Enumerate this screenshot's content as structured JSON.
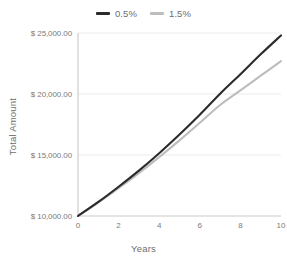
{
  "chart_data": {
    "type": "line",
    "title": "",
    "xlabel": "Years",
    "ylabel": "Total Amount",
    "xlim": [
      0,
      10
    ],
    "ylim": [
      10000,
      25000
    ],
    "grid": true,
    "legend_position": "top-center",
    "x": [
      0,
      1,
      2,
      3,
      4,
      5,
      6,
      7,
      8,
      9,
      10
    ],
    "xticks": [
      "0",
      "2",
      "4",
      "6",
      "8",
      "10"
    ],
    "xtick_values": [
      0,
      2,
      4,
      6,
      8,
      10
    ],
    "yticks": [
      "$ 10,000.00",
      "$ 15,000.00",
      "$ 20,000.00",
      "$ 25,000.00"
    ],
    "ytick_values": [
      10000,
      15000,
      20000,
      25000
    ],
    "series": [
      {
        "name": "0.5%",
        "color": "#2b2b2b",
        "values": [
          10000,
          11150,
          12400,
          13720,
          15150,
          16680,
          18300,
          20020,
          21620,
          23250,
          24800
        ]
      },
      {
        "name": "1.5%",
        "color": "#bdbdbd",
        "values": [
          10000,
          11100,
          12280,
          13520,
          14830,
          16200,
          17640,
          19100,
          20300,
          21500,
          22700
        ]
      }
    ]
  },
  "legend": {
    "items": [
      {
        "label": "0.5%",
        "color": "#2b2b2b"
      },
      {
        "label": "1.5%",
        "color": "#bdbdbd"
      }
    ]
  },
  "axes": {
    "y_title": "Total Amount",
    "x_title": "Years"
  },
  "colors": {
    "background": "#ffffff",
    "grid": "#ececec",
    "axis": "#c9c9c9",
    "text": "#6d6d6d",
    "tick_text": "#7a7a7a"
  }
}
